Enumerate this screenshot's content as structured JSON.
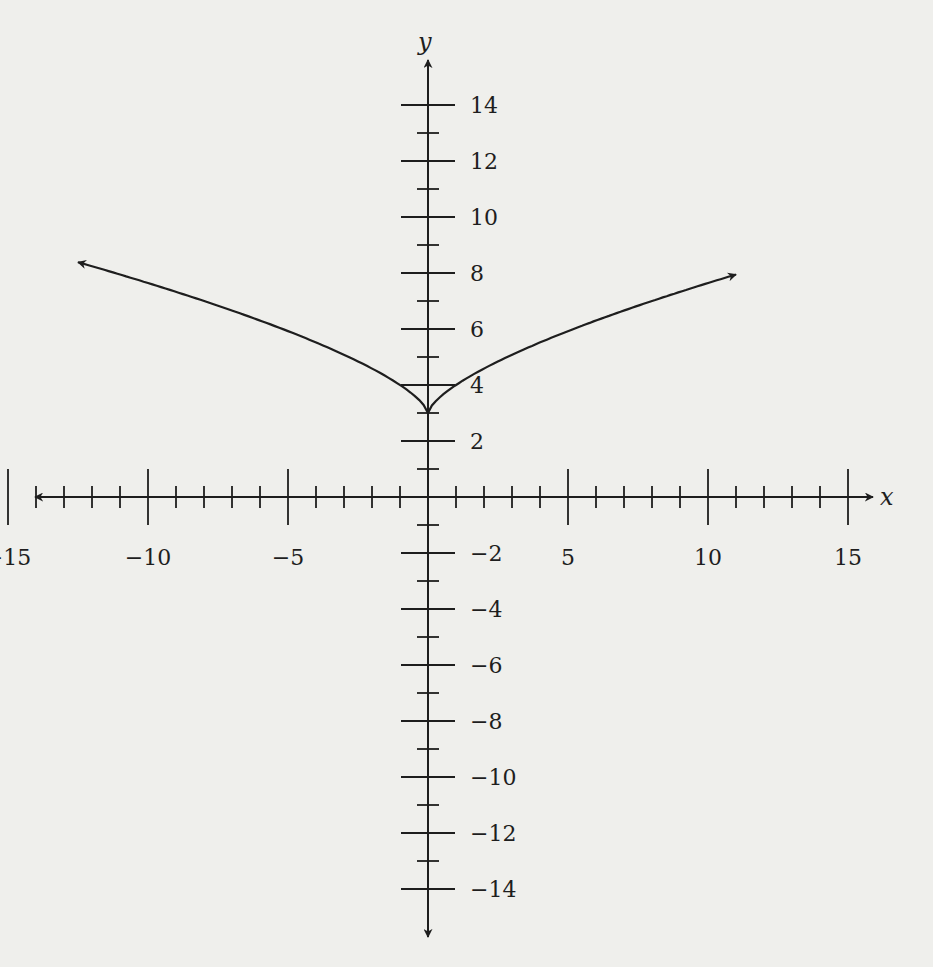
{
  "chart_data": {
    "type": "line",
    "title": "",
    "xlabel": "x",
    "ylabel": "y",
    "xlim": [
      -15,
      15
    ],
    "ylim": [
      -14,
      14
    ],
    "grid": false,
    "x_major_ticks": [
      -15,
      -10,
      -5,
      5,
      10,
      15
    ],
    "x_major_tick_labels": [
      "−15",
      "−10",
      "−5",
      "5",
      "10",
      "15"
    ],
    "x_minor_step": 1,
    "y_major_ticks": [
      14,
      12,
      10,
      8,
      6,
      4,
      2,
      -2,
      -4,
      -6,
      -8,
      -10,
      -12,
      -14
    ],
    "y_major_tick_labels": [
      "14",
      "12",
      "10",
      "8",
      "6",
      "4",
      "2",
      "−2",
      "−4",
      "−6",
      "−8",
      "−10",
      "−12",
      "−14"
    ],
    "y_minor_step": 1,
    "series": [
      {
        "name": "curve",
        "description": "cusp-shaped curve symmetric about y-axis, vertex at (0, 3), arrows on both ends",
        "approx_function": "y = |x|^(2/3) + 3",
        "x": [
          -12.5,
          -10,
          -8,
          -6,
          -4,
          -2,
          -1,
          0,
          1,
          2,
          4,
          6,
          8,
          10,
          11
        ],
        "y": [
          8.4,
          7.6,
          7.0,
          6.3,
          5.5,
          4.6,
          4.0,
          3.0,
          4.0,
          4.6,
          5.5,
          6.3,
          7.0,
          7.6,
          8.5
        ],
        "arrow_start": true,
        "arrow_end": true,
        "color": "#1e1e1e"
      }
    ]
  },
  "colors": {
    "background": "#efefec",
    "ink": "#1e1e1e"
  }
}
